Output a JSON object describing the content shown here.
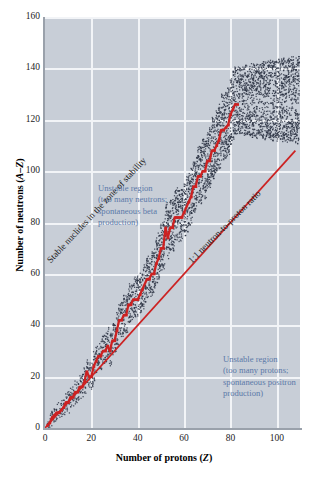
{
  "chart_data": {
    "type": "scatter",
    "title": "",
    "xlabel": "Number of protons (Z)",
    "ylabel": "Number of neutrons (A–Z)",
    "xlim": [
      0,
      110
    ],
    "ylim": [
      0,
      160
    ],
    "xticks": [
      0,
      20,
      40,
      60,
      80,
      100
    ],
    "yticks": [
      0,
      20,
      40,
      60,
      80,
      100,
      120,
      140,
      160
    ],
    "grid": true,
    "legend_position": "none",
    "series": [
      {
        "name": "Stable nuclides (zone of stability)",
        "color": "#cc2222",
        "marker": "square",
        "description": "Red band of stable nuclides curving above the 1:1 line; N≈Z at low Z, rising to N≈1.5Z near Z=83",
        "points": [
          [
            1,
            1
          ],
          [
            2,
            2
          ],
          [
            3,
            4
          ],
          [
            4,
            5
          ],
          [
            5,
            6
          ],
          [
            6,
            6
          ],
          [
            7,
            7
          ],
          [
            8,
            8
          ],
          [
            9,
            10
          ],
          [
            10,
            10
          ],
          [
            11,
            12
          ],
          [
            12,
            12
          ],
          [
            13,
            14
          ],
          [
            14,
            14
          ],
          [
            15,
            16
          ],
          [
            16,
            16
          ],
          [
            17,
            18
          ],
          [
            18,
            22
          ],
          [
            19,
            20
          ],
          [
            20,
            20
          ],
          [
            21,
            24
          ],
          [
            22,
            26
          ],
          [
            23,
            28
          ],
          [
            24,
            28
          ],
          [
            25,
            30
          ],
          [
            26,
            30
          ],
          [
            27,
            32
          ],
          [
            28,
            30
          ],
          [
            29,
            34
          ],
          [
            30,
            34
          ],
          [
            31,
            38
          ],
          [
            32,
            42
          ],
          [
            33,
            42
          ],
          [
            34,
            44
          ],
          [
            35,
            44
          ],
          [
            36,
            48
          ],
          [
            37,
            48
          ],
          [
            38,
            50
          ],
          [
            39,
            50
          ],
          [
            40,
            50
          ],
          [
            41,
            52
          ],
          [
            42,
            54
          ],
          [
            44,
            58
          ],
          [
            45,
            58
          ],
          [
            46,
            60
          ],
          [
            47,
            60
          ],
          [
            48,
            64
          ],
          [
            49,
            66
          ],
          [
            50,
            70
          ],
          [
            51,
            70
          ],
          [
            52,
            78
          ],
          [
            53,
            74
          ],
          [
            54,
            78
          ],
          [
            55,
            78
          ],
          [
            56,
            82
          ],
          [
            57,
            82
          ],
          [
            58,
            82
          ],
          [
            59,
            82
          ],
          [
            60,
            84
          ],
          [
            62,
            88
          ],
          [
            63,
            90
          ],
          [
            64,
            94
          ],
          [
            65,
            94
          ],
          [
            66,
            98
          ],
          [
            67,
            98
          ],
          [
            68,
            100
          ],
          [
            69,
            100
          ],
          [
            70,
            104
          ],
          [
            71,
            104
          ],
          [
            72,
            108
          ],
          [
            73,
            108
          ],
          [
            74,
            110
          ],
          [
            75,
            112
          ],
          [
            76,
            116
          ],
          [
            77,
            116
          ],
          [
            78,
            117
          ],
          [
            79,
            118
          ],
          [
            80,
            122
          ],
          [
            81,
            124
          ],
          [
            82,
            126
          ],
          [
            83,
            126
          ]
        ]
      },
      {
        "name": "Unstable (radioactive) nuclides",
        "color": "#2d3444",
        "marker": "dot",
        "description": "Dense speckled band of unstable nuclides flanking the zone of stability on both sides, extending to Z≈109, N≈157"
      }
    ],
    "reference_lines": [
      {
        "name": "1:1 neutron-to-proton ratio",
        "color": "#cc2222",
        "from": [
          0,
          0
        ],
        "to": [
          108,
          108
        ],
        "slope": 1,
        "intercept": 0
      }
    ],
    "annotations": [
      {
        "name": "unstable-region-neutron-rich",
        "text": "Unstable region\n(too many neutrons;\nspontaneous beta\nproduction)",
        "color": "#5b79a8",
        "at": [
          10,
          100
        ]
      },
      {
        "name": "unstable-region-proton-rich",
        "text": "Unstable region\n(too many protons;\nspontaneous positron\nproduction)",
        "color": "#5b79a8",
        "at": [
          58,
          35
        ]
      },
      {
        "name": "zone-of-stability-label",
        "text": "Stable nuclides in the\nzone of stability",
        "color": "#1b1b1b",
        "rotation": -47
      },
      {
        "name": "ratio-line-label",
        "text": "1:1 neutron-to-proton ratio",
        "color": "#1b1b1b",
        "rotation": -45
      }
    ]
  },
  "axes": {
    "x_title_main": "Number of protons (",
    "x_title_italic": "Z",
    "x_title_end": ")",
    "y_title_main": "Number of neutrons (",
    "y_title_italic": "A–Z",
    "y_title_end": ")",
    "x_tick_labels": [
      "0",
      "20",
      "40",
      "60",
      "80",
      "100"
    ],
    "y_tick_labels": [
      "0",
      "20",
      "40",
      "60",
      "80",
      "100",
      "120",
      "140",
      "160"
    ]
  },
  "annotations": {
    "neutron_rich": "Unstable region\n(too many neutrons;\nspontaneous beta\nproduction)",
    "proton_rich": "Unstable region\n(too many protons;\nspontaneous positron\nproduction)",
    "zone_of_stability": "Stable nuclides in the zone of stability",
    "ratio_line": "1:1 neutron-to-proton ratio"
  },
  "colors": {
    "plot_background": "#c8ced7",
    "gridline": "#f2f4f7",
    "stable_band": "#cc2222",
    "unstable_dots": "#2d3444",
    "annotation_blue": "#5b79a8",
    "axis": "#9aa1ab",
    "page_background": "#ffffff"
  }
}
